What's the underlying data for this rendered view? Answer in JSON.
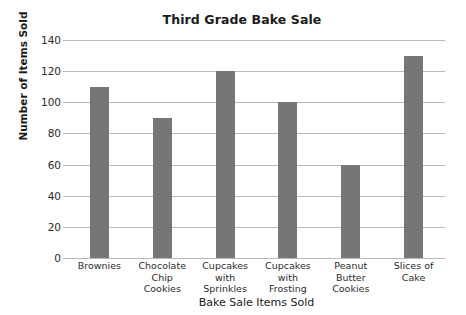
{
  "chart_data": {
    "type": "bar",
    "title": "Third Grade Bake Sale",
    "xlabel": "Bake Sale Items Sold",
    "ylabel": "Number of Items Sold",
    "categories": [
      "Brownies",
      "Chocolate Chip Cookies",
      "Cupcakes with Sprinkles",
      "Cupcakes with Frosting",
      "Peanut Butter Cookies",
      "Slices of Cake"
    ],
    "category_lines": [
      [
        "Brownies"
      ],
      [
        "Chocolate",
        "Chip",
        "Cookies"
      ],
      [
        "Cupcakes",
        "with",
        "Sprinkles"
      ],
      [
        "Cupcakes",
        "with",
        "Frosting"
      ],
      [
        "Peanut",
        "Butter",
        "Cookies"
      ],
      [
        "Slices of",
        "Cake"
      ]
    ],
    "values": [
      110,
      90,
      120,
      100,
      60,
      130
    ],
    "ylim": [
      0,
      140
    ],
    "ytick_step": 20,
    "yticks": [
      0,
      20,
      40,
      60,
      80,
      100,
      120,
      140
    ],
    "grid": true,
    "legend": false,
    "bar_color": "#767676",
    "gridline_color": "#b9b9b9",
    "background_color": "#ffffff",
    "text_color": "#1b1b1b"
  }
}
